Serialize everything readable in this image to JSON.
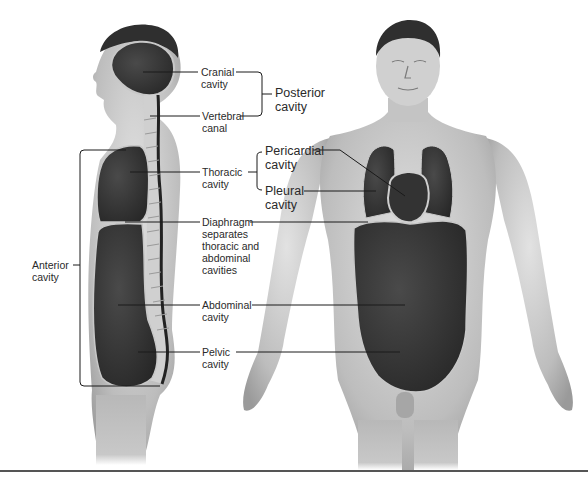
{
  "figure": {
    "views": [
      {
        "name": "lateral-view",
        "description": "Sagittal section of body showing cavities"
      },
      {
        "name": "anterior-view",
        "description": "Front view of body showing cavities"
      }
    ],
    "colors": {
      "background": "#ffffff",
      "skin_light": "#d8d8d8",
      "skin_mid": "#b5b5b5",
      "skin_dark": "#8e8e8e",
      "cavity": "#3a3a3a",
      "cavity_outline": "#c8c8c8",
      "hair": "#2f2f2f",
      "spine": "#cfcfcf",
      "leader_line": "#1a1a1a"
    }
  },
  "labels": {
    "cranial": [
      "Cranial",
      "cavity"
    ],
    "vertebral": [
      "Vertebral",
      "canal"
    ],
    "posterior": [
      "Posterior",
      "cavity"
    ],
    "thoracic": [
      "Thoracic",
      "cavity"
    ],
    "pericardial": [
      "Pericardial",
      "cavity"
    ],
    "pleural": [
      "Pleural",
      "cavity"
    ],
    "diaphragm": [
      "Diaphragm",
      "separates",
      "thoracic and",
      "abdominal",
      "cavities"
    ],
    "anterior": [
      "Anterior",
      "cavity"
    ],
    "abdominal": [
      "Abdominal",
      "cavity"
    ],
    "pelvic": [
      "Pelvic",
      "cavity"
    ]
  }
}
